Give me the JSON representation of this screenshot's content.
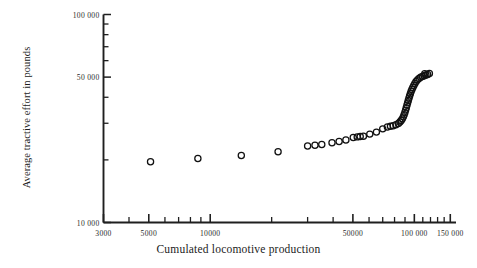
{
  "chart_data": {
    "type": "scatter",
    "title": "",
    "xlabel": "Cumulated locomotive production",
    "ylabel": "Average tractive effort in pounds",
    "xscale": "log",
    "yscale": "log",
    "xlim": [
      3000,
      160000
    ],
    "ylim": [
      10000,
      100000
    ],
    "grid": false,
    "legend": "none",
    "marker": "open-circle",
    "xticklabels": [
      "3000",
      "5000",
      "10000",
      "50000",
      "100 000",
      "150 000"
    ],
    "xtickvalues": [
      3000,
      5000,
      10000,
      50000,
      100000,
      150000
    ],
    "yticklabels": [
      "10 000",
      "50 000",
      "100 000"
    ],
    "ytickvalues": [
      10000,
      50000,
      100000
    ],
    "xminorticks": [
      4000,
      6000,
      7000,
      8000,
      9000,
      20000,
      30000,
      40000,
      60000,
      70000,
      80000,
      90000,
      110000,
      120000,
      130000,
      140000
    ],
    "yminorticks": [
      20000,
      30000,
      40000,
      60000,
      70000,
      80000,
      90000
    ],
    "points": [
      {
        "x": 5100,
        "y": 19600
      },
      {
        "x": 8700,
        "y": 20300
      },
      {
        "x": 14200,
        "y": 21000
      },
      {
        "x": 21500,
        "y": 21900
      },
      {
        "x": 30000,
        "y": 23300
      },
      {
        "x": 32600,
        "y": 23500
      },
      {
        "x": 35200,
        "y": 23700
      },
      {
        "x": 39500,
        "y": 24200
      },
      {
        "x": 42800,
        "y": 24500
      },
      {
        "x": 46200,
        "y": 24900
      },
      {
        "x": 50200,
        "y": 25600
      },
      {
        "x": 52500,
        "y": 25800
      },
      {
        "x": 54300,
        "y": 25900
      },
      {
        "x": 56300,
        "y": 26000
      },
      {
        "x": 60500,
        "y": 26600
      },
      {
        "x": 65200,
        "y": 27200
      },
      {
        "x": 70000,
        "y": 28200
      },
      {
        "x": 73800,
        "y": 28800
      },
      {
        "x": 76400,
        "y": 29000
      },
      {
        "x": 78800,
        "y": 29200
      },
      {
        "x": 81200,
        "y": 29500
      },
      {
        "x": 83500,
        "y": 29900
      },
      {
        "x": 85000,
        "y": 30400
      },
      {
        "x": 86200,
        "y": 30900
      },
      {
        "x": 87300,
        "y": 31500
      },
      {
        "x": 88300,
        "y": 32200
      },
      {
        "x": 89100,
        "y": 33000
      },
      {
        "x": 89900,
        "y": 33800
      },
      {
        "x": 90600,
        "y": 34700
      },
      {
        "x": 91300,
        "y": 35600
      },
      {
        "x": 92000,
        "y": 36600
      },
      {
        "x": 92700,
        "y": 37600
      },
      {
        "x": 93400,
        "y": 38600
      },
      {
        "x": 94100,
        "y": 39600
      },
      {
        "x": 94800,
        "y": 40600
      },
      {
        "x": 95600,
        "y": 41600
      },
      {
        "x": 96400,
        "y": 42600
      },
      {
        "x": 97300,
        "y": 43600
      },
      {
        "x": 98300,
        "y": 44600
      },
      {
        "x": 99400,
        "y": 45600
      },
      {
        "x": 100600,
        "y": 46600
      },
      {
        "x": 102000,
        "y": 47600
      },
      {
        "x": 103600,
        "y": 48500
      },
      {
        "x": 105400,
        "y": 49300
      },
      {
        "x": 107400,
        "y": 49900
      },
      {
        "x": 109500,
        "y": 50400
      },
      {
        "x": 111800,
        "y": 50800
      },
      {
        "x": 114000,
        "y": 51200
      },
      {
        "x": 116200,
        "y": 51500
      },
      {
        "x": 112500,
        "y": 51900
      },
      {
        "x": 118500,
        "y": 52100
      }
    ]
  },
  "colors": {
    "axis": "#1f1f1f",
    "marker": "#111111",
    "background": "#ffffff"
  }
}
